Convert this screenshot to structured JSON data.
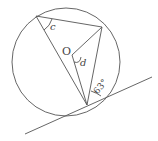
{
  "diagram": {
    "type": "circle-tangent-geometry",
    "labels": {
      "center": "O",
      "angle_c": "c",
      "angle_d": "d",
      "angle_given": "63°"
    },
    "colors": {
      "stroke": "#555555",
      "text": "#444444",
      "background": "#ffffff"
    }
  }
}
